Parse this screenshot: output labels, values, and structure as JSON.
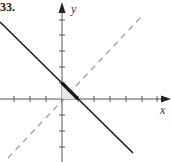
{
  "figure": {
    "problem_number": "33.",
    "x_axis_label": "x",
    "y_axis_label": "y",
    "colors": {
      "axes": "#555555",
      "solid_line": "#1a1a1a",
      "dashed_line": "#9a9a9a",
      "shaded_region": "#333333",
      "background": "#ffffff"
    },
    "elements": [
      {
        "name": "solid-line",
        "description": "decreasing line with slope -1, positive y-intercept"
      },
      {
        "name": "dashed-line",
        "description": "reference line y = x"
      },
      {
        "name": "shaded-triangle",
        "description": "small region between axes and solid line near origin"
      }
    ]
  }
}
